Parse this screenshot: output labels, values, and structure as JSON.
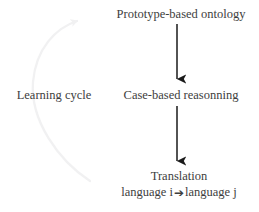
{
  "diagram": {
    "title_text": "Learning cycle diagram",
    "background_color": "#ffffff",
    "text_color": "#3d3d3d",
    "arrow_color": "#1a1a1a",
    "arc_color": "#f2f2f3",
    "nodes": [
      {
        "id": "prototype-based-ontology",
        "label": "Prototype-based ontology"
      },
      {
        "id": "case-based-reasonning",
        "label": "Case-based reasonning"
      },
      {
        "id": "translation",
        "line_1": "Translation",
        "line_2_before": "language i",
        "line_2_arrow": "➔",
        "line_2_after": "language j"
      }
    ],
    "cycle": {
      "label": "Learning cycle",
      "arrow_direction": "counterclockwise-upward"
    },
    "connectors": [
      {
        "id": "arrow-prototype-to-casebased",
        "from": "prototype-based-ontology",
        "to": "case-based-reasonning"
      },
      {
        "id": "arrow-casebased-to-translation",
        "from": "case-based-reasonning",
        "to": "translation"
      }
    ]
  }
}
